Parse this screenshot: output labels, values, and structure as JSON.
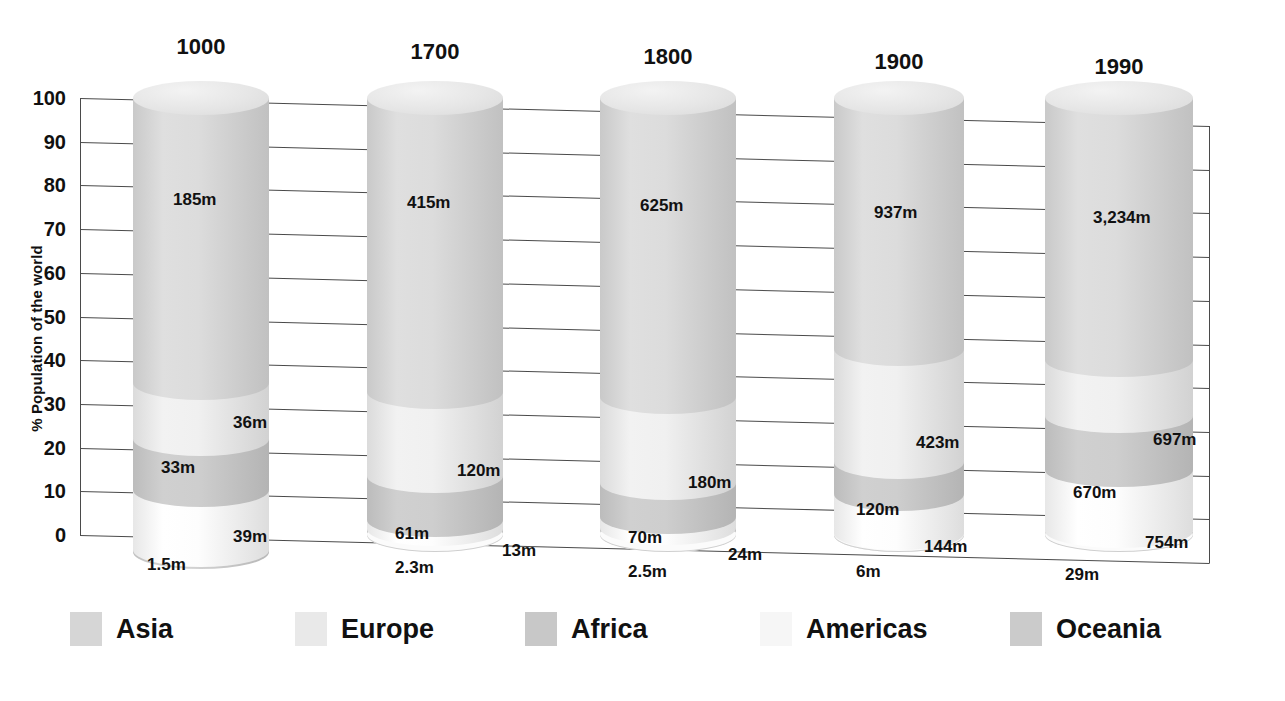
{
  "chart_data": {
    "type": "bar",
    "subtype": "stacked-100-percent-cylinder",
    "title": "",
    "xlabel": "",
    "ylabel": "% Population of the world",
    "ylim": [
      0,
      100
    ],
    "yticks": [
      100,
      90,
      80,
      70,
      60,
      50,
      40,
      30,
      20,
      10,
      0
    ],
    "grid": true,
    "legend_position": "bottom",
    "categories": [
      "1000",
      "1700",
      "1800",
      "1900",
      "1990"
    ],
    "series": [
      {
        "name": "Asia",
        "color": "#d6d6d6",
        "values": [
          185,
          415,
          625,
          937,
          3234
        ],
        "labels": [
          "185m",
          "415m",
          "625m",
          "937m",
          "3,234m"
        ],
        "percent": [
          65.3,
          67.2,
          68.5,
          57.4,
          59.9
        ]
      },
      {
        "name": "Europe",
        "color": "#e9e9e9",
        "values": [
          36,
          120,
          180,
          423,
          697
        ],
        "labels": [
          "36m",
          "120m",
          "180m",
          "423m",
          "697m"
        ],
        "percent": [
          12.7,
          19.4,
          19.7,
          25.9,
          12.9
        ]
      },
      {
        "name": "Africa",
        "color": "#c8c8c8",
        "values": [
          33,
          61,
          70,
          120,
          670
        ],
        "labels": [
          "33m",
          "61m",
          "70m",
          "120m",
          "670m"
        ],
        "percent": [
          11.6,
          9.9,
          7.7,
          7.4,
          12.4
        ]
      },
      {
        "name": "Americas",
        "color": "#f6f6f6",
        "values": [
          39,
          13,
          24,
          144,
          754
        ],
        "labels": [
          "39m",
          "13m",
          "24m",
          "144m",
          "754m"
        ],
        "percent": [
          13.8,
          2.1,
          2.6,
          8.8,
          14.0
        ]
      },
      {
        "name": "Oceania",
        "color": "#cbcbcb",
        "values": [
          1.5,
          2.3,
          2.5,
          6,
          29
        ],
        "labels": [
          "1.5m",
          "2.3m",
          "2.5m",
          "6m",
          "29m"
        ],
        "percent": [
          0.5,
          0.4,
          0.3,
          0.4,
          0.5
        ]
      }
    ]
  },
  "axis": {
    "ylabel": "% Population of the world",
    "ticks": [
      "100",
      "90",
      "80",
      "70",
      "60",
      "50",
      "40",
      "30",
      "20",
      "10",
      "0"
    ]
  },
  "columns": [
    {
      "year": "1000",
      "segments": [
        {
          "region": "Asia",
          "label": "185m"
        },
        {
          "region": "Europe",
          "label": "36m"
        },
        {
          "region": "Africa",
          "label": "33m"
        },
        {
          "region": "Americas",
          "label": "39m"
        },
        {
          "region": "Oceania",
          "label": "1.5m"
        }
      ]
    },
    {
      "year": "1700",
      "segments": [
        {
          "region": "Asia",
          "label": "415m"
        },
        {
          "region": "Europe",
          "label": "120m"
        },
        {
          "region": "Africa",
          "label": "61m"
        },
        {
          "region": "Americas",
          "label": "13m"
        },
        {
          "region": "Oceania",
          "label": "2.3m"
        }
      ]
    },
    {
      "year": "1800",
      "segments": [
        {
          "region": "Asia",
          "label": "625m"
        },
        {
          "region": "Europe",
          "label": "180m"
        },
        {
          "region": "Africa",
          "label": "70m"
        },
        {
          "region": "Americas",
          "label": "24m"
        },
        {
          "region": "Oceania",
          "label": "2.5m"
        }
      ]
    },
    {
      "year": "1900",
      "segments": [
        {
          "region": "Asia",
          "label": "937m"
        },
        {
          "region": "Europe",
          "label": "423m"
        },
        {
          "region": "Africa",
          "label": "120m"
        },
        {
          "region": "Americas",
          "label": "144m"
        },
        {
          "region": "Oceania",
          "label": "6m"
        }
      ]
    },
    {
      "year": "1990",
      "segments": [
        {
          "region": "Asia",
          "label": "3,234m"
        },
        {
          "region": "Europe",
          "label": "697m"
        },
        {
          "region": "Africa",
          "label": "670m"
        },
        {
          "region": "Americas",
          "label": "754m"
        },
        {
          "region": "Oceania",
          "label": "29m"
        }
      ]
    }
  ],
  "legend": {
    "items": [
      {
        "label": "Asia",
        "color": "#d6d6d6"
      },
      {
        "label": "Europe",
        "color": "#e9e9e9"
      },
      {
        "label": "Africa",
        "color": "#c8c8c8"
      },
      {
        "label": "Americas",
        "color": "#f6f6f6"
      },
      {
        "label": "Oceania",
        "color": "#cbcbcb"
      }
    ]
  }
}
